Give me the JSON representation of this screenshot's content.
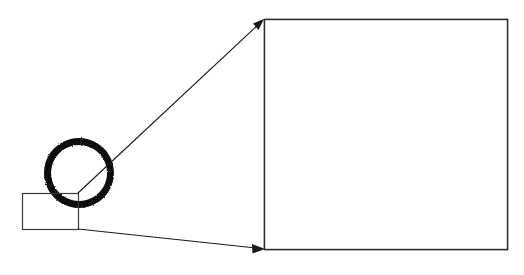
{
  "figure": {
    "type": "technical-illustration",
    "topic": "circle-rasterization-aliasing",
    "background_color": "#ffffff",
    "ink_color": "#111111",
    "line_color": "#1a1a1a",
    "width": 524,
    "height": 275,
    "caption": "",
    "labels": []
  },
  "source_view": {
    "name": "rasterized-circle",
    "circle": {
      "center_x": 79,
      "center_y": 173,
      "outer_radius": 35,
      "inner_radius": 28,
      "stroke_thickness": 7,
      "fill_color": "#111111",
      "jagged": true
    },
    "roi_rectangle": {
      "x": 22,
      "y": 193,
      "width": 56,
      "height": 36,
      "stroke_color": "#3a3a3a",
      "fill": "none"
    }
  },
  "detail_view": {
    "name": "magnified-pixel-grid",
    "box": {
      "x": 264,
      "y": 19,
      "width": 244,
      "height": 231,
      "stroke_color": "#2b2b2b",
      "fill_color": "#ffffff"
    },
    "staircase": {
      "description": "jagged staircase band of black pixels tracing the circle arc",
      "fill_color": "#121212",
      "step_count": 13,
      "step_width_px": 14,
      "step_height_px": 14
    }
  },
  "leader_lines": [
    {
      "name": "upper-leader",
      "from_x": 78,
      "from_y": 193,
      "to_x": 264,
      "to_y": 20,
      "arrow": "end"
    },
    {
      "name": "lower-leader",
      "from_x": 78,
      "from_y": 229,
      "to_x": 263,
      "to_y": 249,
      "arrow": "end"
    }
  ],
  "chart_data": {
    "type": "scatter",
    "title": "",
    "xlabel": "",
    "ylabel": "",
    "xlim": [
      264,
      508
    ],
    "ylim": [
      19,
      250
    ],
    "grid": false,
    "band_top_runs": [
      {
        "x": 309,
        "y": 20,
        "w": 36
      },
      {
        "x": 323,
        "y": 34,
        "w": 36
      },
      {
        "x": 337,
        "y": 48,
        "w": 36
      },
      {
        "x": 351,
        "y": 62,
        "w": 36
      },
      {
        "x": 365,
        "y": 76,
        "w": 38
      },
      {
        "x": 379,
        "y": 90,
        "w": 40
      },
      {
        "x": 393,
        "y": 104,
        "w": 42
      },
      {
        "x": 407,
        "y": 118,
        "w": 46
      },
      {
        "x": 421,
        "y": 132,
        "w": 52
      },
      {
        "x": 435,
        "y": 146,
        "w": 62
      },
      {
        "x": 449,
        "y": 160,
        "w": 59
      },
      {
        "x": 463,
        "y": 174,
        "w": 45
      },
      {
        "x": 477,
        "y": 188,
        "w": 31
      }
    ],
    "band_bottom_runs": [
      {
        "x": 309,
        "y": 48,
        "w": 14
      },
      {
        "x": 323,
        "y": 62,
        "w": 14
      },
      {
        "x": 337,
        "y": 76,
        "w": 14
      },
      {
        "x": 351,
        "y": 90,
        "w": 14
      },
      {
        "x": 365,
        "y": 104,
        "w": 14
      },
      {
        "x": 379,
        "y": 118,
        "w": 14
      },
      {
        "x": 393,
        "y": 132,
        "w": 14
      },
      {
        "x": 407,
        "y": 146,
        "w": 14
      },
      {
        "x": 421,
        "y": 160,
        "w": 14
      },
      {
        "x": 435,
        "y": 174,
        "w": 14
      },
      {
        "x": 449,
        "y": 188,
        "w": 14
      },
      {
        "x": 463,
        "y": 202,
        "w": 14
      },
      {
        "x": 477,
        "y": 212,
        "w": 31
      }
    ]
  }
}
